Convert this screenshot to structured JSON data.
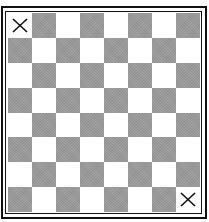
{
  "board": {
    "rows": 8,
    "cols": 8,
    "colors": {
      "light": "#ffffff",
      "dark": "#9b9b9b",
      "border": "#111111",
      "mark": "#111111"
    },
    "marks": [
      {
        "row": 0,
        "col": 0,
        "symbol": "X"
      },
      {
        "row": 7,
        "col": 7,
        "symbol": "X"
      }
    ]
  }
}
